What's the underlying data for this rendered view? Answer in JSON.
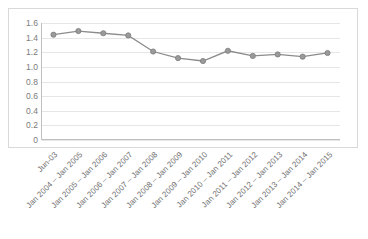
{
  "chart_data": {
    "type": "line",
    "title": "",
    "subtitle": "",
    "xlabel": "",
    "ylabel": "",
    "ylim": [
      0,
      1.6
    ],
    "ytick_labels": [
      "1.6",
      "1.4",
      "1.2",
      "1.0",
      "0.8",
      "0.6",
      "0.4",
      "0.2",
      "0"
    ],
    "ytick_values": [
      1.6,
      1.4,
      1.2,
      1.0,
      0.8,
      0.6,
      0.4,
      0.2,
      0
    ],
    "grid": true,
    "legend": "none",
    "markers": true,
    "series_color": "#8c8c8c",
    "marker_color": "#9a9a9a",
    "categories": [
      "Jun-03",
      "Jan 2004 – Jan 2005",
      "Jan 2005 – Jan 2006",
      "Jan 2006 – Jan 2007",
      "Jan 2007 – Jan 2008",
      "Jan 2008 – Jan 2009",
      "Jan 2009 – Jan 2010",
      "Jan 2010 – Jan 2011",
      "Jan 2011 – Jan 2012",
      "Jan 2012 – Jan 2013",
      "Jan 2013 – Jan 2014",
      "Jan 2014 – Jan 2015"
    ],
    "values": [
      1.44,
      1.49,
      1.46,
      1.43,
      1.21,
      1.12,
      1.08,
      1.22,
      1.15,
      1.17,
      1.14,
      1.19
    ]
  }
}
